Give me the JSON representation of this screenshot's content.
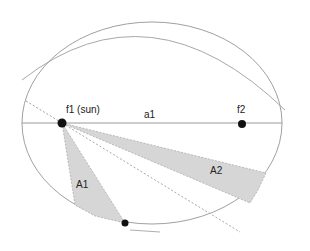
{
  "diagram": {
    "labels": {
      "focus1": "f1 (sun)",
      "focus2": "f2",
      "semi_major": "a1",
      "area1": "A1",
      "area2": "A2"
    },
    "colors": {
      "line": "#9a9a9a",
      "dot": "#111111",
      "shade": "#d6d6d6",
      "background": "#ffffff"
    },
    "ellipse": {
      "cx": 152,
      "cy": 123,
      "rx": 130,
      "ry": 101
    },
    "foci": [
      {
        "x": 62,
        "y": 123
      },
      {
        "x": 242,
        "y": 123
      }
    ],
    "planet": {
      "x": 125,
      "y": 223
    }
  }
}
